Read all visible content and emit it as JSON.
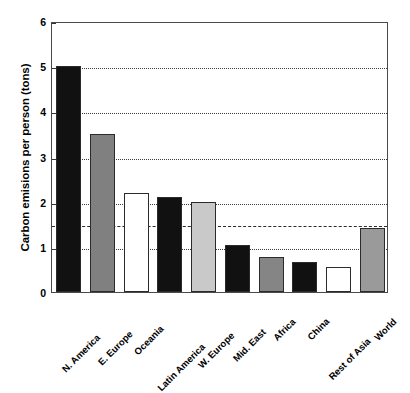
{
  "chart_data": {
    "type": "bar",
    "title": "",
    "xlabel": "",
    "ylabel": "Carbon emisions per person (tons)",
    "ylim": [
      0,
      6
    ],
    "yticks": [
      0,
      1,
      2,
      3,
      4,
      5,
      6
    ],
    "ytick_labels": [
      "0",
      "1",
      "2",
      "3",
      "4",
      "5",
      "6"
    ],
    "grid": "horizontal dotted gridlines at each integer tick",
    "legend": "none",
    "reference_line": {
      "value": 1.5,
      "style": "dashed",
      "label": ""
    },
    "categories": [
      "N. America",
      "E. Europe",
      "Oceania",
      "Latin America",
      "W. Europe",
      "Mid. East",
      "Africa",
      "China",
      "Rest of Asia",
      "World"
    ],
    "values": [
      5.0,
      3.5,
      2.2,
      2.1,
      2.0,
      1.05,
      0.78,
      0.67,
      0.55,
      1.42
    ],
    "bar_colors": [
      "#111111",
      "#808080",
      "#ffffff",
      "#111111",
      "#c9c9c9",
      "#111111",
      "#858585",
      "#111111",
      "#ffffff",
      "#9a9a9a"
    ],
    "bar_edge_color": "#2b2b2b",
    "axis_color": "#4a4a4a",
    "background": "#ffffff"
  }
}
